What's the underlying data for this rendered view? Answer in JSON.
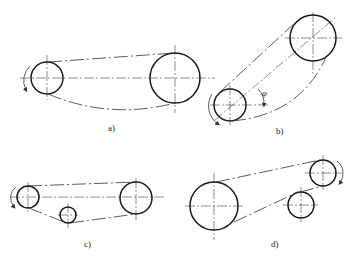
{
  "figure": {
    "panels": [
      {
        "id": "a",
        "label": "a)",
        "pulleys": [
          {
            "role": "driver",
            "cx": 47,
            "cy": 78,
            "r": 16
          },
          {
            "role": "driven",
            "cx": 175,
            "cy": 78,
            "r": 25
          }
        ]
      },
      {
        "id": "b",
        "label": "b)",
        "angle_symbol": "φ",
        "pulleys": [
          {
            "role": "driver",
            "cx": 230,
            "cy": 105,
            "r": 16
          },
          {
            "role": "driven",
            "cx": 313,
            "cy": 38,
            "r": 23
          }
        ]
      },
      {
        "id": "c",
        "label": "c)",
        "pulleys": [
          {
            "role": "driver",
            "cx": 28,
            "cy": 197,
            "r": 11
          },
          {
            "role": "idler",
            "cx": 68,
            "cy": 215,
            "r": 8
          },
          {
            "role": "driven",
            "cx": 136,
            "cy": 198,
            "r": 16
          }
        ]
      },
      {
        "id": "d",
        "label": "d)",
        "pulleys": [
          {
            "role": "large",
            "cx": 214,
            "cy": 206,
            "r": 24
          },
          {
            "role": "idler",
            "cx": 301,
            "cy": 205,
            "r": 13
          },
          {
            "role": "driver",
            "cx": 323,
            "cy": 173,
            "r": 13
          }
        ]
      }
    ]
  },
  "labels": {
    "a": "a)",
    "b": "b)",
    "c": "c)",
    "d": "d)",
    "phi": "φ"
  }
}
